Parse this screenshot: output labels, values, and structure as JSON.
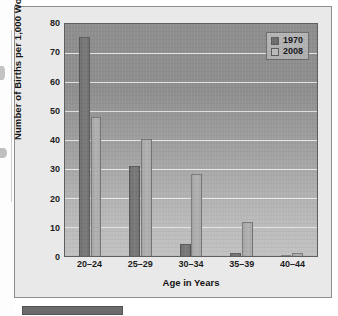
{
  "chart_data": {
    "type": "bar",
    "title": "",
    "xlabel": "Age in Years",
    "ylabel": "Number of Births per 1,000 Women",
    "categories": [
      "20–24",
      "25–29",
      "30–34",
      "35–39",
      "40–44"
    ],
    "series": [
      {
        "name": "1970",
        "values": [
          75.5,
          31.2,
          4.2,
          1.2,
          0.3
        ],
        "color": "#727272"
      },
      {
        "name": "2008",
        "values": [
          48.0,
          40.5,
          28.4,
          11.9,
          1.0
        ],
        "color": "#ababab"
      }
    ],
    "ylim": [
      0,
      80
    ],
    "yticks": [
      0,
      10,
      20,
      30,
      40,
      50,
      60,
      70,
      80
    ],
    "ytick_labels": [
      "0",
      "10",
      "20",
      "30",
      "40",
      "50",
      "60",
      "70",
      "80"
    ],
    "grid": true,
    "grid_axis": "y",
    "legend_position": "top-right",
    "legend_entries": [
      "1970",
      "2008"
    ],
    "annotations": []
  },
  "figure": {
    "background_color": "#e9e9e9",
    "plot_background_top": "#8e8e8e",
    "plot_background_bottom": "#c2c2c2",
    "border_color": "#8d8d8d",
    "caption_bar_color": "#6b6b6b"
  }
}
